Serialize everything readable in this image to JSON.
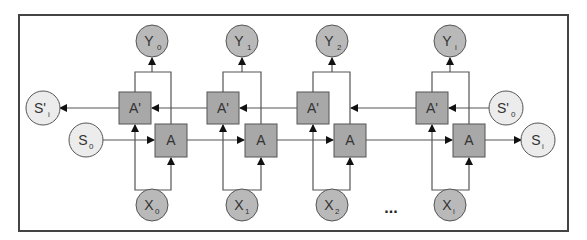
{
  "diagram": {
    "colors": {
      "box": "#a8a8a8",
      "io_node": "#b9b9b9",
      "state_node": "#ececec",
      "stroke": "#555555"
    },
    "columns": [
      {
        "x_label": "X",
        "x_sub": "0",
        "y_label": "Y",
        "y_sub": "0",
        "forward": "A",
        "backward": "A'"
      },
      {
        "x_label": "X",
        "x_sub": "1",
        "y_label": "Y",
        "y_sub": "1",
        "forward": "A",
        "backward": "A'"
      },
      {
        "x_label": "X",
        "x_sub": "2",
        "y_label": "Y",
        "y_sub": "2",
        "forward": "A",
        "backward": "A'"
      },
      {
        "x_label": "X",
        "x_sub": "i",
        "y_label": "Y",
        "y_sub": "i",
        "forward": "A",
        "backward": "A'"
      }
    ],
    "states": {
      "fwd_start": {
        "label": "S",
        "sub": "0"
      },
      "fwd_end": {
        "label": "S",
        "sub": "i"
      },
      "bwd_start": {
        "label": "S'",
        "sub": "0"
      },
      "bwd_end": {
        "label": "S'",
        "sub": "i"
      }
    },
    "ellipsis": "..."
  }
}
